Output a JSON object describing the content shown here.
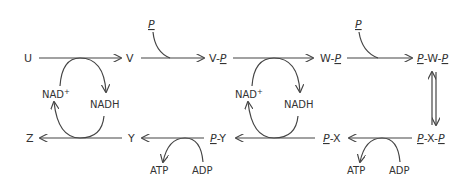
{
  "diagram": {
    "colors": {
      "ink": "#444444",
      "text": "#333333",
      "background": "#ffffff"
    },
    "row1": {
      "nodes": [
        "U",
        "V",
        "V-P",
        "W-P",
        "P-W-P"
      ],
      "u": "U",
      "v": "V",
      "vp_base": "V-",
      "vp_p": "P",
      "wp_base": "W-",
      "wp_p": "P",
      "pwp_p1": "P",
      "pwp_mid": "-W-",
      "pwp_p2": "P",
      "p_input_1": "P",
      "p_input_2": "P",
      "cofactor_1_in": "NAD",
      "cofactor_1_sup": "+",
      "cofactor_1_out": "NADH",
      "cofactor_2_in": "NAD",
      "cofactor_2_sup": "+",
      "cofactor_2_out": "NADH"
    },
    "row2": {
      "nodes": [
        "P-X-P",
        "P-X",
        "P-Y",
        "Y",
        "Z"
      ],
      "pxp_p1": "P",
      "pxp_mid": "-X-",
      "pxp_p2": "P",
      "px_p": "P",
      "px_base": "-X",
      "py_p": "P",
      "py_base": "-Y",
      "y": "Y",
      "z": "Z",
      "atp_1": "ATP",
      "adp_1": "ADP",
      "atp_2": "ATP",
      "adp_2": "ADP"
    }
  }
}
